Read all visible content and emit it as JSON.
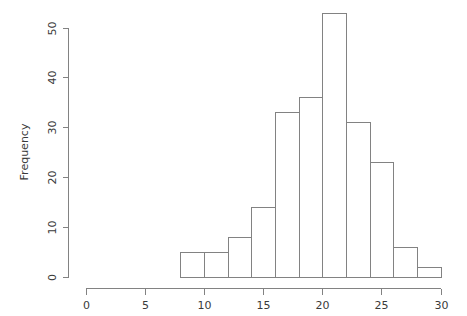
{
  "chart_data": {
    "type": "bar",
    "title": "",
    "subtitle": "",
    "xlabel": "",
    "ylabel": "Frequency",
    "grid": false,
    "legend": "none",
    "bin_width": 2,
    "bin_edges": [
      8,
      10,
      12,
      14,
      16,
      18,
      20,
      22,
      24,
      26,
      28,
      30
    ],
    "categories": [
      "8-10",
      "10-12",
      "12-14",
      "14-16",
      "16-18",
      "18-20",
      "20-22",
      "22-24",
      "24-26",
      "26-28",
      "28-30"
    ],
    "values": [
      5,
      5,
      8,
      14,
      33,
      36,
      53,
      31,
      23,
      6,
      2
    ],
    "xlim": [
      0,
      30
    ],
    "ylim": [
      0,
      53
    ],
    "x_ticks": [
      0,
      5,
      10,
      15,
      20,
      25,
      30
    ],
    "x_tick_labels": [
      "0",
      "5",
      "10",
      "15",
      "20",
      "25",
      "30"
    ],
    "y_ticks": [
      0,
      10,
      20,
      30,
      40,
      50
    ],
    "y_tick_labels": [
      "0",
      "10",
      "20",
      "30",
      "40",
      "50"
    ],
    "bar_fill": "#ffffff",
    "bar_stroke": "#828282",
    "axis_color": "#828282",
    "text_color": "#3a3a3a",
    "background": "#ffffff"
  }
}
